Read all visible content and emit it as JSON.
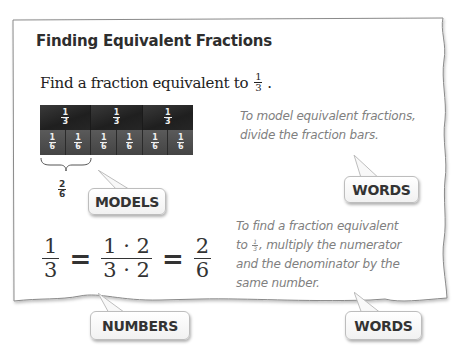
{
  "title": "Finding Equivalent Fractions",
  "prompt": {
    "text": "Find a fraction equivalent to",
    "fraction": {
      "num": "1",
      "den": "3"
    },
    "end": "."
  },
  "model": {
    "thirds": [
      {
        "num": "1",
        "den": "3"
      },
      {
        "num": "1",
        "den": "3"
      },
      {
        "num": "1",
        "den": "3"
      }
    ],
    "sixths": [
      {
        "num": "1",
        "den": "6"
      },
      {
        "num": "1",
        "den": "6"
      },
      {
        "num": "1",
        "den": "6"
      },
      {
        "num": "1",
        "den": "6"
      },
      {
        "num": "1",
        "den": "6"
      },
      {
        "num": "1",
        "den": "6"
      }
    ],
    "brace_fraction": {
      "num": "2",
      "den": "6"
    },
    "colors": {
      "thirds": "#262626",
      "sixths": "#4c4c4c"
    }
  },
  "callouts": {
    "models": "MODELS",
    "words1": "WORDS",
    "numbers": "NUMBERS",
    "words2": "WORDS"
  },
  "words1_text": {
    "line1": "To model equivalent fractions,",
    "line2": "divide the fraction bars."
  },
  "words2_text": {
    "line1": "To find a fraction equivalent",
    "line2_pre": "to",
    "line2_frac": {
      "num": "1",
      "den": "3"
    },
    "line2_post": ", multiply the numerator",
    "line3": "and the denominator by the",
    "line4": "same number."
  },
  "equation": {
    "lhs": {
      "num": "1",
      "den": "3"
    },
    "eq1": "=",
    "mid": {
      "num": "1 · 2",
      "den": "3 · 2"
    },
    "eq2": "=",
    "rhs": {
      "num": "2",
      "den": "6"
    }
  }
}
